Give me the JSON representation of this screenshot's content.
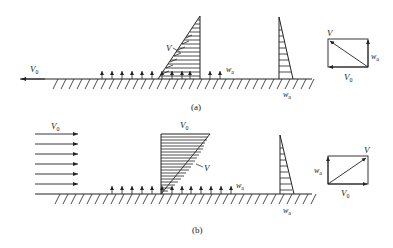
{
  "figure": {
    "panel_a": {
      "caption": "(a)",
      "freestream_label": "V",
      "freestream_sub": "0",
      "velocity_profile_label": "V",
      "suction_label": "w",
      "suction_sub": "a",
      "suction_profile_label": "w",
      "suction_profile_sub": "a",
      "vector_diagram": {
        "resultant_label": "V",
        "vertical_label": "w",
        "vertical_sub": "a",
        "horizontal_label": "V",
        "horizontal_sub": "0"
      }
    },
    "panel_b": {
      "caption": "(b)",
      "freestream_label": "V",
      "freestream_sub": "0",
      "profile_top_label": "V",
      "profile_top_sub": "0",
      "velocity_profile_label": "V",
      "suction_label": "w",
      "suction_sub": "a",
      "suction_profile_label": "w",
      "suction_profile_sub": "a",
      "vector_diagram": {
        "resultant_label": "V",
        "vertical_label": "w",
        "vertical_sub": "a",
        "horizontal_label": "V",
        "horizontal_sub": "0"
      }
    },
    "colors": {
      "ink": "#222222",
      "background": "#ffffff"
    }
  }
}
